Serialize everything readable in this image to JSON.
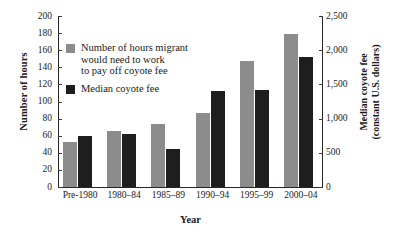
{
  "chart_data": {
    "type": "bar",
    "title": "",
    "categories": [
      "Pre-1980",
      "1980–84",
      "1985–89",
      "1990–94",
      "1995–99",
      "2000–04"
    ],
    "series": [
      {
        "name": "Number of hours migrant\nwould need to work\nto pay off coyote fee",
        "axis": "left",
        "color": "#8c8c8c",
        "values": [
          53,
          65,
          74,
          86,
          147,
          179
        ]
      },
      {
        "name": "Median coyote fee",
        "axis": "right",
        "color": "#1e1e1e",
        "values": [
          750,
          775,
          550,
          1410,
          1425,
          1900
        ]
      }
    ],
    "xlabel": "Year",
    "ylabel": "Number of hours",
    "ylabel_right": "Median coyote fee\n(constant U.S. dollars)",
    "ylim": [
      0,
      200
    ],
    "ylim_right": [
      0,
      2500
    ],
    "yticks": [
      "200",
      "180",
      "160",
      "140",
      "120",
      "100",
      "80",
      "60",
      "40",
      "20",
      "0"
    ],
    "ytick_values": [
      200,
      180,
      160,
      140,
      120,
      100,
      80,
      60,
      40,
      20,
      0
    ],
    "yticks_right": [
      "2,500",
      "2,000",
      "1,500",
      "1,000",
      "500",
      "0"
    ],
    "ytick_values_right": [
      2500,
      2000,
      1500,
      1000,
      500,
      0
    ],
    "grid": false,
    "legend_position": "upper-left-inside"
  },
  "legend": {
    "items": [
      {
        "label": "Number of hours migrant\nwould need to work\nto pay off coyote fee",
        "color": "#8c8c8c"
      },
      {
        "label": "Median coyote fee",
        "color": "#1e1e1e"
      }
    ]
  },
  "axes": {
    "left_title": "Number of hours",
    "right_title": "Median coyote fee\n(constant U.S. dollars)",
    "x_title": "Year"
  }
}
